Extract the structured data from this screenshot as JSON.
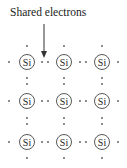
{
  "diagram": {
    "annotation": "Shared electrons",
    "atom_symbol": "Si",
    "grid": {
      "rows": 3,
      "cols": 3
    },
    "atoms": [
      {
        "row": 0,
        "col": 0,
        "label": "Si"
      },
      {
        "row": 0,
        "col": 1,
        "label": "Si"
      },
      {
        "row": 0,
        "col": 2,
        "label": "Si"
      },
      {
        "row": 1,
        "col": 0,
        "label": "Si"
      },
      {
        "row": 1,
        "col": 1,
        "label": "Si"
      },
      {
        "row": 1,
        "col": 2,
        "label": "Si"
      },
      {
        "row": 2,
        "col": 0,
        "label": "Si"
      },
      {
        "row": 2,
        "col": 1,
        "label": "Si"
      },
      {
        "row": 2,
        "col": 2,
        "label": "Si"
      }
    ],
    "colors": {
      "stroke": "#444444",
      "text": "#222222",
      "dot": "#555555"
    }
  }
}
